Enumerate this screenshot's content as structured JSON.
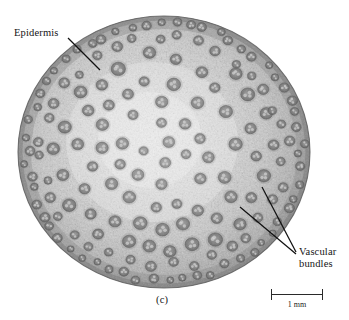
{
  "figure": {
    "panel_label": "(c)",
    "background_color": "#ffffff"
  },
  "annotations": [
    {
      "name": "epidermis",
      "text": "Epidermis",
      "leader_from": [
        68,
        38
      ],
      "leader_to": [
        100,
        70
      ]
    },
    {
      "name": "vascular-bundles",
      "line1": "Vascular",
      "line2": "bundles",
      "leader_a_from": [
        296,
        252
      ],
      "leader_a_to": [
        262,
        187
      ],
      "leader_b_from": [
        296,
        254
      ],
      "leader_b_to": [
        240,
        207
      ]
    }
  ],
  "labels": {
    "epidermis": "Epidermis",
    "vascular_line1": "Vascular",
    "vascular_line2": "bundles",
    "panel": "(c)"
  },
  "scale_bar": {
    "label": "1 mm",
    "length_px": 52,
    "color": "#2a2a2a"
  },
  "specimen": {
    "shape": "ellipse",
    "center_x": 164,
    "center_y": 152,
    "radius_x": 146,
    "radius_y": 136,
    "ground_tissue_color": "#c9c9c9",
    "center_highlight_color": "#ededed",
    "rim_color": "#8e8e8e",
    "bundle_color": "#6f6f6f",
    "bundle_core_color": "#d8d8d8",
    "outline_color": "#5a5a5a"
  },
  "chart_data": {
    "type": "scatter",
    "xlabel": "",
    "ylabel": "",
    "peripheral_bundle_count": 58,
    "inner_bundle_count": 74,
    "peripheral_bundle_radius_px": 4.2,
    "inner_bundle_radius_px": 5.6
  }
}
